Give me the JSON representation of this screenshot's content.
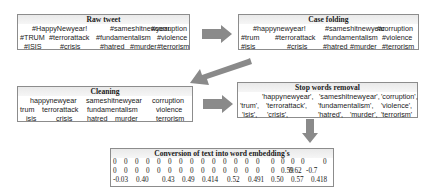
{
  "colors": {
    "arrow": "#8a8a8a",
    "border": "#8c8c8c",
    "title_bg": "#ececec"
  },
  "raw_tweet": {
    "title": "Raw tweet",
    "rows": [
      [
        "#HappyNewyear!",
        "#sameshitnewyear",
        "#corruption"
      ],
      [
        "#TRUM",
        "#terrorattack",
        "#fundamentalism",
        "#violence"
      ],
      [
        "#ISIS",
        "#crisis",
        "#hatred",
        "#murder",
        "#terrorism"
      ]
    ]
  },
  "case_folding": {
    "title": "Case folding",
    "rows": [
      [
        "#happynewyear!",
        "#sameshitnewyear",
        "#corruption"
      ],
      [
        "#trum",
        "#terrorattack",
        "#fundamentalism",
        "#violence"
      ],
      [
        "#isis",
        "#crisis",
        "#hatred",
        "#murder",
        "#terrorism"
      ]
    ]
  },
  "cleaning": {
    "title": "Cleaning",
    "rows": [
      [
        "happynewyear",
        "sameshitnewyear",
        "corruption"
      ],
      [
        "trum",
        "terrorattack",
        "fundamentalism",
        "violence"
      ],
      [
        "isis",
        "crisis",
        "hatred",
        "murder",
        "terrorism"
      ]
    ]
  },
  "stop_words": {
    "title": "Stop words removal",
    "rows": [
      [
        "'happynewyear',",
        "'sameshitnewyear',",
        "'corruption',"
      ],
      [
        "'trum',",
        "'terrorattack',",
        "'fundamentalism',",
        "'violence',"
      ],
      [
        "'isis',",
        "'crisis',",
        "'hatred',",
        "'murder',",
        "'terrorism'"
      ]
    ]
  },
  "embedding": {
    "title": "Conversion of text into word embedding's",
    "rows": [
      [
        "0",
        "0",
        "0",
        "0",
        "0",
        "0",
        "0",
        "0",
        "0",
        "0",
        "0",
        "0",
        "0",
        "0",
        "0",
        "0",
        "0",
        "0",
        "0"
      ],
      [
        "0",
        "0",
        "0",
        "0",
        "0",
        "0",
        "0",
        "0",
        "0",
        "0",
        "0",
        "0",
        "0",
        "0",
        "0",
        "0.59",
        "0.62",
        "-0.7"
      ],
      [
        "-0.03",
        "0.40",
        "0.43",
        "0.49",
        "0.414",
        "0.52",
        "0.491",
        "0.50",
        "0.57",
        "0.418"
      ]
    ]
  }
}
